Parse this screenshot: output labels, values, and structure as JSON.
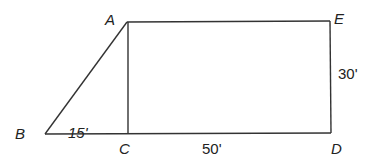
{
  "diagram": {
    "points": {
      "A": {
        "label": "A",
        "x": 127,
        "y": 22
      },
      "B": {
        "label": "B",
        "x": 45,
        "y": 134
      },
      "C": {
        "label": "C",
        "x": 128,
        "y": 134
      },
      "D": {
        "label": "D",
        "x": 331,
        "y": 133
      },
      "E": {
        "label": "E",
        "x": 330,
        "y": 21
      }
    },
    "measurements": {
      "BC": "15'",
      "CD": "50'",
      "DE": "30'"
    },
    "colors": {
      "line": "#333333",
      "text": "#222222",
      "background": "#ffffff"
    }
  }
}
